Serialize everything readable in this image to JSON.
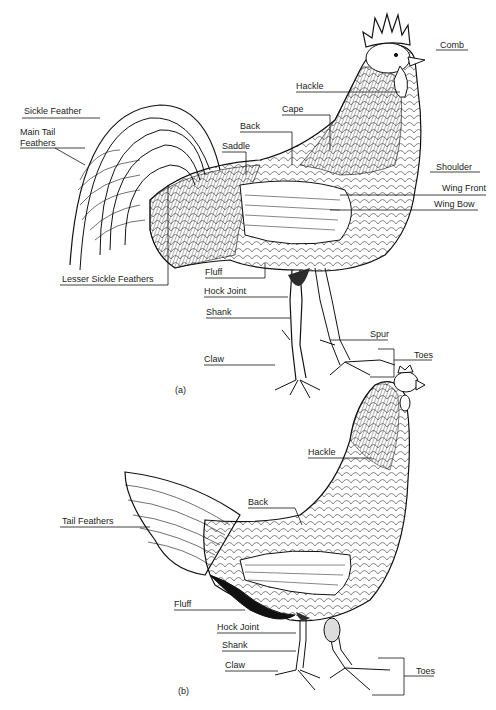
{
  "figure_a": {
    "caption": "(a)",
    "subject": "rooster",
    "labels": {
      "comb": "Comb",
      "hackle": "Hackle",
      "cape": "Cape",
      "back": "Back",
      "saddle": "Saddle",
      "sickle_feather": "Sickle Feather",
      "main_tail_feathers_1": "Main Tail",
      "main_tail_feathers_2": "Feathers",
      "shoulder": "Shoulder",
      "wing_front": "Wing Front",
      "wing_bow": "Wing Bow",
      "lesser_sickle_feathers": "Lesser Sickle Feathers",
      "fluff": "Fluff",
      "hock_joint": "Hock Joint",
      "shank": "Shank",
      "spur": "Spur",
      "claw": "Claw",
      "toes": "Toes"
    }
  },
  "figure_b": {
    "caption": "(b)",
    "subject": "hen",
    "labels": {
      "hackle": "Hackle",
      "back": "Back",
      "tail_feathers": "Tail Feathers",
      "fluff": "Fluff",
      "hock_joint": "Hock Joint",
      "shank": "Shank",
      "claw": "Claw",
      "toes": "Toes"
    }
  }
}
